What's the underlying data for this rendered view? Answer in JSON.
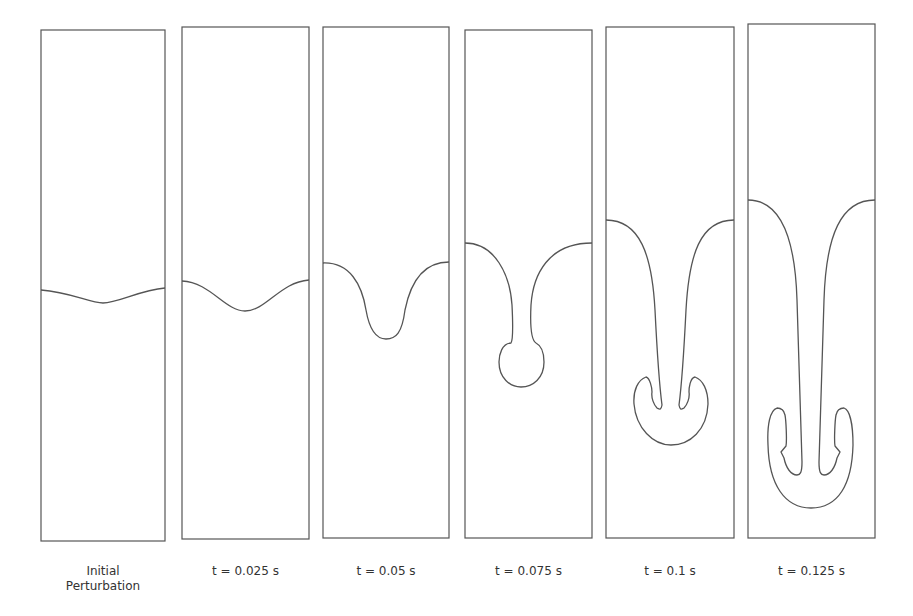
{
  "figure": {
    "line_color": "#555555",
    "panels": [
      {
        "label": "Initial\nPerturbation",
        "x": 41,
        "y": 30,
        "w": 124,
        "h": 511,
        "interface": "M41,290 C70,292 90,303 103,303 C118,303 140,290 165,288"
      },
      {
        "label": "t = 0.025 s",
        "x": 182,
        "y": 27,
        "w": 127,
        "h": 512,
        "interface": "M182,281 C210,282 225,311 245,311 C266,311 280,282 309,280"
      },
      {
        "label": "t = 0.05 s",
        "x": 323,
        "y": 27,
        "w": 126,
        "h": 511,
        "interface": "M323,263 C350,262 362,285 366,310 C370,333 378,339 386,339 C396,339 402,333 405,310 C410,285 422,262 449,262"
      },
      {
        "label": "t = 0.075 s",
        "x": 465,
        "y": 30,
        "w": 127,
        "h": 508,
        "interface": "M465,243 C495,243 510,275 512,305 C513,325 513,340 511,343 C502,343 499,355 499,362 C499,378 510,387 521,387 C533,387 544,378 544,362 C544,355 542,346 536,343 C531,340 530,325 531,305 C533,275 548,243 592,243"
      },
      {
        "label": "t = 0.1 s",
        "x": 606,
        "y": 27,
        "w": 128,
        "h": 511,
        "interface": "M606,220 C640,220 652,255 655,310 C657,350 660,390 662,405 C661,411 659,409 657,408 C654,405 651,398 652,392 C652,388 650,378 646,377 C638,380 633,390 634,404 C636,428 653,445 671,445 C690,445 707,430 708,404 C708,390 703,380 695,377 C690,378 689,388 689,392 C690,398 687,405 684,408 C682,409 680,411 679,405 C681,390 684,350 686,310 C689,255 700,220 734,220"
      },
      {
        "label": "t = 0.125 s",
        "x": 748,
        "y": 24,
        "w": 127,
        "h": 514,
        "interface": "M748,200 C780,200 795,235 797,300 C799,370 801,440 802,462 C802,473 800,475 797,475 C791,475 786,468 784,458 L781,452 L786,446 C787,440 786,420 785,415 C784,410 782,408 777,408 C770,410 767,425 768,445 C769,485 785,508 811,508 C838,508 852,485 853,445 C853,425 850,410 844,408 C839,408 837,410 836,415 C835,420 834,440 835,446 L840,452 L837,458 C835,468 830,475 824,475 C821,475 819,473 819,462 C820,440 822,370 824,300 C826,235 841,200 875,200"
      }
    ]
  }
}
